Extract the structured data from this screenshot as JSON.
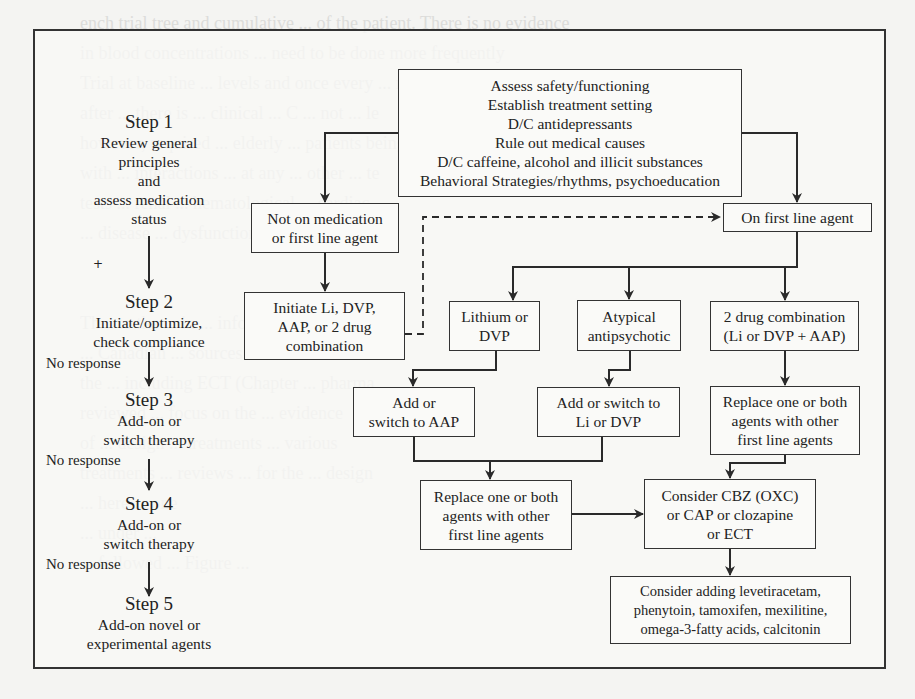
{
  "figure": {
    "initial_box": {
      "lines": [
        "Assess safety/functioning",
        "Establish treatment setting",
        "D/C antidepressants",
        "Rule out medical causes",
        "D/C caffeine, alcohol and illicit substances",
        "Behavioral Strategies/rhythms, psychoeducation"
      ]
    },
    "steps": [
      {
        "title": "Step 1",
        "lines": [
          "Review general",
          "principles",
          "and",
          "assess medication",
          "status"
        ]
      },
      {
        "title": "Step 2",
        "lines": [
          "Initiate/optimize,",
          "check compliance"
        ]
      },
      {
        "title": "Step 3",
        "lines": [
          "Add-on or",
          "switch therapy"
        ]
      },
      {
        "title": "Step 4",
        "lines": [
          "Add-on or",
          "switch therapy"
        ]
      },
      {
        "title": "Step 5",
        "lines": [
          "Add-on novel or",
          "experimental agents"
        ]
      }
    ],
    "no_response_label": "No response",
    "plus_mark": "+",
    "boxes": {
      "not_on_medication": [
        "Not on medication",
        "or first line agent"
      ],
      "initiate": [
        "Initiate Li, DVP,",
        "AAP, or 2 drug",
        "combination"
      ],
      "on_first_line": [
        "On first line agent"
      ],
      "lithium_or_dvp": [
        "Lithium or",
        "DVP"
      ],
      "atypical": [
        "Atypical",
        "antipsychotic"
      ],
      "two_drug": [
        "2 drug combination",
        "(Li or DVP + AAP)"
      ],
      "add_switch_aap": [
        "Add or",
        "switch to AAP"
      ],
      "add_switch_li": [
        "Add or switch to",
        "Li or DVP"
      ],
      "replace_right": [
        "Replace one or both",
        "agents with other",
        "first line agents"
      ],
      "replace_middle": [
        "Replace one or both",
        "agents with other",
        "first line agents"
      ],
      "consider_cbz": [
        "Consider CBZ (OXC)",
        "or CAP or clozapine",
        "or ECT"
      ],
      "consider_adding": [
        "Consider adding levetiracetam,",
        "phenytoin, tamoxifen, mexilitine,",
        "omega-3-fatty acids, calcitonin"
      ]
    },
    "line_color": "#2a2a2a"
  },
  "background_bleed": [
    "ench trial tree and cumulative ... of the patient. There is no evidence",
    "in blood concentrations ... need to be done more frequently",
    "Trial at baseline ... levels and once every ... months there",
    "after ... there is ... clinical ... C ... not ... le",
    "however, required ... elderly ... patients being treated",
    "with ... interactions ... at any ... other ... te",
    "tests ... renal ... hematological ... cardiac",
    "... disease ... dysfunction",
    "",
    "",
    "Th... to the ... in ... inform",
    "... Canadian ... sources",
    "the ... including ECT (Chapter ... pharma",
    "reviewed ... focus on the ... evidence",
    "of ... design ... treatments ... various",
    "treatments ... reviews ... for the ... design",
    "... here ... one",
    "... under ...",
    "... followed ... Figure ..."
  ]
}
